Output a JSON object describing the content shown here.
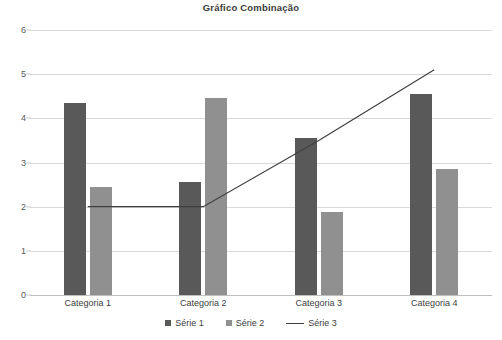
{
  "chart_data": {
    "type": "bar",
    "title": "Gráfico Combinação",
    "xlabel": "",
    "ylabel": "",
    "categories": [
      "Categoria 1",
      "Categoria 2",
      "Categoria 3",
      "Categoria 4"
    ],
    "series": [
      {
        "name": "Série 1",
        "type": "bar",
        "color": "#595959",
        "values": [
          4.35,
          2.55,
          3.55,
          4.55
        ]
      },
      {
        "name": "Série 2",
        "type": "bar",
        "color": "#909090",
        "values": [
          2.45,
          4.45,
          1.88,
          2.85
        ]
      },
      {
        "name": "Série 3",
        "type": "line",
        "color": "#3f3f3f",
        "values": [
          2.0,
          2.0,
          3.5,
          5.1
        ]
      }
    ],
    "ylim": [
      0,
      6
    ],
    "yticks": [
      6,
      5,
      4,
      3,
      2,
      1,
      0
    ],
    "ytick_labels": [
      "6",
      "5",
      "4",
      "3",
      "2",
      "1",
      "0"
    ],
    "grid": true,
    "legend_position": "bottom"
  },
  "legend": {
    "items": [
      {
        "label": "Série 1",
        "marker": "square-dark",
        "color": "#595959"
      },
      {
        "label": "Série 2",
        "marker": "square-mid",
        "color": "#909090"
      },
      {
        "label": "Série 3",
        "marker": "line",
        "color": "#3f3f3f"
      }
    ]
  },
  "colors": {
    "gridline": "#d9d9d9",
    "axis": "#bfbfbf",
    "text": "#404040",
    "title": "#3b3b3b",
    "background": "#ffffff"
  }
}
